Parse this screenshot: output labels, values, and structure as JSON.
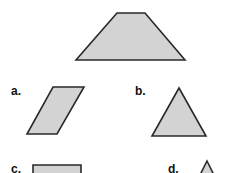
{
  "figure": {
    "fill_color": "#d3d3d3",
    "stroke_color": "#2a2a2a",
    "reference_shape": {
      "name": "trapezoid",
      "points": "117,13 145,13 185,60 76,60"
    },
    "options": [
      {
        "label": "a.",
        "shape": "parallelogram",
        "label_x": 11,
        "label_y": 95,
        "points": "53,87 84,87 57,134 27,134"
      },
      {
        "label": "b.",
        "shape": "triangle",
        "label_x": 135,
        "label_y": 95,
        "points": "179,88 206,136 152,136"
      },
      {
        "label": "c.",
        "shape": "rectangle",
        "label_x": 11,
        "label_y": 173,
        "points": "33,165 81,165 81,180 33,180"
      },
      {
        "label": "d.",
        "shape": "small-triangle",
        "label_x": 168,
        "label_y": 173,
        "points": "207,161 214,175 200,175"
      }
    ]
  }
}
